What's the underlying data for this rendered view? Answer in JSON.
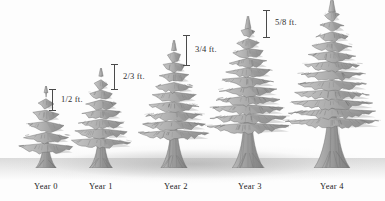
{
  "figure": {
    "kind": "tree-growth-illustration",
    "background_color": "#fdfdfd",
    "ink_color": "#4a4a4a",
    "foliage_color": "#a9a9a9",
    "trunk_color": "#9a9a9a",
    "shadow_color": "#a8a8a8"
  },
  "chart_data": {
    "type": "bar",
    "title": "",
    "xlabel": "",
    "ylabel": "Growth (ft.)",
    "categories": [
      "Year 0",
      "Year 1",
      "Year 2",
      "Year 3",
      "Year 4"
    ],
    "growth_labels": [
      "1/2 ft.",
      "2/3 ft.",
      "3/4 ft.",
      "5/8 ft.",
      ""
    ],
    "values": [
      0.5,
      0.667,
      0.75,
      0.625,
      null
    ],
    "grid": false,
    "legend": false
  },
  "trees": [
    {
      "id": "tree-year-0",
      "year_label": "Year 0",
      "left": 18,
      "width": 56,
      "height": 82,
      "label_left": 18,
      "label_width": 56,
      "label_top": 181
    },
    {
      "id": "tree-year-1",
      "year_label": "Year 1",
      "left": 70,
      "width": 62,
      "height": 100,
      "label_left": 70,
      "label_width": 62,
      "label_top": 181
    },
    {
      "id": "tree-year-2",
      "year_label": "Year 2",
      "left": 138,
      "width": 72,
      "height": 128,
      "label_left": 140,
      "label_width": 72,
      "label_top": 181
    },
    {
      "id": "tree-year-3",
      "year_label": "Year 3",
      "left": 205,
      "width": 86,
      "height": 152,
      "label_left": 209,
      "label_width": 82,
      "label_top": 181
    },
    {
      "id": "tree-year-4",
      "year_label": "Year 4",
      "left": 283,
      "width": 98,
      "height": 170,
      "label_left": 289,
      "label_width": 86,
      "label_top": 181
    }
  ],
  "measures": [
    {
      "id": "measure-half-foot",
      "label": "1/2 ft.",
      "value_text": "1/2",
      "unit_text": "ft.",
      "left": 52,
      "top": 89,
      "height": 22,
      "label_top": 5
    },
    {
      "id": "measure-two-thirds-foot",
      "label": "2/3 ft.",
      "value_text": "2/3",
      "unit_text": "ft.",
      "left": 114,
      "top": 64,
      "height": 26,
      "label_top": 7
    },
    {
      "id": "measure-three-quarters-foot",
      "label": "3/4 ft.",
      "value_text": "3/4",
      "unit_text": "ft.",
      "left": 186,
      "top": 35,
      "height": 31,
      "label_top": 9
    },
    {
      "id": "measure-five-eighths-foot",
      "label": "5/8 ft.",
      "value_text": "5/8",
      "unit_text": "ft.",
      "left": 266,
      "top": 10,
      "height": 28,
      "label_top": 7
    }
  ]
}
